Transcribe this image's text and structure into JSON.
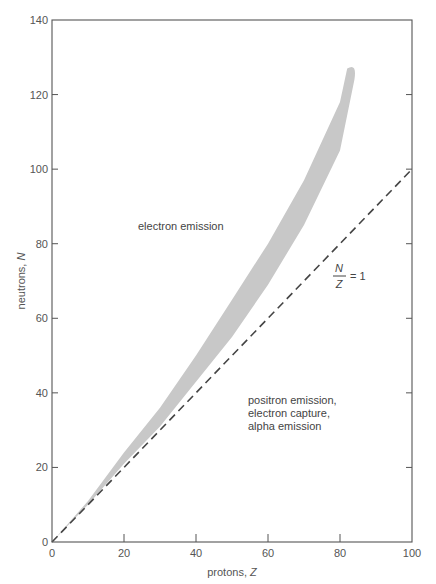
{
  "chart_data": {
    "type": "area",
    "title": "",
    "xlabel": "protons, Z",
    "ylabel": "neutrons, N",
    "xlim": [
      0,
      100
    ],
    "ylim": [
      0,
      140
    ],
    "x_ticks": [
      0,
      20,
      40,
      60,
      80,
      100
    ],
    "y_ticks": [
      0,
      20,
      40,
      60,
      80,
      100,
      120,
      140
    ],
    "x_tick_labels": [
      "0",
      "20",
      "40",
      "60",
      "80",
      "100"
    ],
    "y_tick_labels": [
      "0",
      "20",
      "40",
      "60",
      "80",
      "100",
      "120",
      "140"
    ],
    "grid": false,
    "series": [
      {
        "name": "band of stability",
        "style": "filled band",
        "color": "#c8c8c8",
        "upper": [
          [
            0,
            0
          ],
          [
            10,
            11
          ],
          [
            20,
            24
          ],
          [
            30,
            36
          ],
          [
            40,
            50
          ],
          [
            50,
            65
          ],
          [
            60,
            80
          ],
          [
            70,
            97
          ],
          [
            80,
            118
          ],
          [
            82,
            127
          ]
        ],
        "lower": [
          [
            0,
            0
          ],
          [
            10,
            10
          ],
          [
            20,
            21
          ],
          [
            30,
            31
          ],
          [
            40,
            43
          ],
          [
            50,
            55
          ],
          [
            60,
            69
          ],
          [
            70,
            85
          ],
          [
            80,
            105
          ],
          [
            84,
            124
          ]
        ]
      },
      {
        "name": "N/Z = 1",
        "style": "dashed line",
        "color": "#444444",
        "x": [
          0,
          100
        ],
        "y": [
          0,
          100
        ]
      }
    ],
    "annotations": [
      {
        "text": "electron emission",
        "x": 24,
        "y": 84
      },
      {
        "text": "N / Z = 1",
        "x": 80,
        "y": 75
      },
      {
        "text": "positron emission, electron capture, alpha emission",
        "x": 55,
        "y": 38
      }
    ]
  },
  "labels": {
    "xlabel_main": "protons, ",
    "xlabel_var": "Z",
    "ylabel_main": "neutrons, ",
    "ylabel_var": "N",
    "region_upper": "electron emission",
    "region_lower": [
      "positron emission,",
      "electron capture,",
      "alpha emission"
    ],
    "ratio_num": "N",
    "ratio_den": "Z",
    "ratio_eq": "= 1"
  }
}
